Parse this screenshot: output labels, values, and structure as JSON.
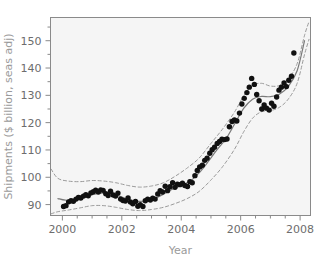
{
  "chart_data": {
    "type": "scatter",
    "title": "",
    "xlabel": "Year",
    "ylabel": "Shipments ($ billion, seas adj)",
    "xlim": [
      1999.6,
      2008.35
    ],
    "ylim": [
      86.0,
      158.5
    ],
    "grid": false,
    "legend": null,
    "x_major_ticks": [
      2000,
      2002,
      2004,
      2006,
      2008
    ],
    "x_major_tick_labels": [
      "2000",
      "2002",
      "2004",
      "2006",
      "2008"
    ],
    "x_minor_tick_step": 0.5,
    "y_major_ticks": [
      90,
      100,
      110,
      120,
      130,
      140,
      150
    ],
    "y_major_tick_labels": [
      "90",
      "100",
      "110",
      "120",
      "130",
      "140",
      "150"
    ],
    "y_minor_tick_step": 5,
    "series": [
      {
        "name": "Shipments (monthly observations)",
        "type": "scatter",
        "marker": "filled-circle",
        "color": "#111111",
        "x": [
          2000.04,
          2000.12,
          2000.21,
          2000.29,
          2000.37,
          2000.46,
          2000.54,
          2000.62,
          2000.71,
          2000.79,
          2000.87,
          2000.96,
          2001.04,
          2001.12,
          2001.21,
          2001.29,
          2001.37,
          2001.46,
          2001.54,
          2001.62,
          2001.71,
          2001.79,
          2001.87,
          2001.96,
          2002.04,
          2002.12,
          2002.21,
          2002.29,
          2002.37,
          2002.46,
          2002.54,
          2002.62,
          2002.71,
          2002.79,
          2002.87,
          2002.96,
          2003.04,
          2003.12,
          2003.21,
          2003.29,
          2003.37,
          2003.46,
          2003.54,
          2003.62,
          2003.71,
          2003.79,
          2003.87,
          2003.96,
          2004.04,
          2004.12,
          2004.21,
          2004.29,
          2004.37,
          2004.46,
          2004.54,
          2004.62,
          2004.71,
          2004.79,
          2004.87,
          2004.96,
          2005.04,
          2005.12,
          2005.21,
          2005.29,
          2005.37,
          2005.46,
          2005.54,
          2005.62,
          2005.71,
          2005.79,
          2005.87,
          2005.96,
          2006.04,
          2006.12,
          2006.21,
          2006.29,
          2006.37,
          2006.46,
          2006.54,
          2006.62,
          2006.71,
          2006.79,
          2006.87,
          2006.96,
          2007.04,
          2007.12,
          2007.21,
          2007.29,
          2007.37,
          2007.46,
          2007.54,
          2007.62,
          2007.71,
          2007.79
        ],
        "y": [
          89.3,
          89.6,
          91.0,
          91.4,
          91.2,
          92.0,
          92.6,
          92.4,
          93.1,
          93.6,
          93.2,
          94.3,
          94.7,
          95.3,
          94.6,
          95.4,
          95.2,
          94.0,
          93.3,
          94.9,
          93.5,
          93.1,
          94.2,
          92.0,
          91.5,
          91.3,
          92.4,
          90.9,
          90.3,
          91.1,
          89.4,
          90.0,
          89.3,
          91.4,
          92.0,
          91.7,
          92.3,
          92.0,
          93.9,
          95.1,
          94.6,
          96.7,
          95.1,
          96.5,
          98.0,
          96.3,
          97.5,
          97.3,
          97.8,
          97.0,
          96.6,
          98.4,
          98.0,
          100.6,
          102.5,
          103.8,
          104.4,
          106.2,
          107.0,
          108.8,
          110.1,
          111.0,
          112.4,
          113.1,
          113.9,
          113.8,
          114.0,
          118.5,
          120.4,
          121.0,
          120.6,
          123.5,
          126.8,
          128.9,
          131.0,
          133.0,
          136.2,
          134.0,
          130.3,
          128.0,
          125.0,
          126.5,
          125.3,
          124.6,
          127.1,
          126.0,
          129.4,
          131.9,
          133.0,
          134.5,
          133.2,
          135.5,
          137.0,
          145.5
        ]
      },
      {
        "name": "Smoothed trend (LOESS fit)",
        "type": "line",
        "style": "solid",
        "color": "#7a7a7a",
        "x": [
          1999.85,
          2000.1,
          2000.4,
          2000.7,
          2001.0,
          2001.3,
          2001.6,
          2001.9,
          2002.2,
          2002.5,
          2002.8,
          2003.1,
          2003.4,
          2003.7,
          2004.0,
          2004.3,
          2004.6,
          2004.9,
          2005.2,
          2005.5,
          2005.8,
          2006.1,
          2006.4,
          2006.7,
          2007.0,
          2007.3,
          2007.6,
          2007.9,
          2008.15
        ],
        "y": [
          92.2,
          91.6,
          91.8,
          92.6,
          93.6,
          94.2,
          94.0,
          93.2,
          92.0,
          91.2,
          91.3,
          92.2,
          93.8,
          95.6,
          97.0,
          98.6,
          101.6,
          105.6,
          110.0,
          114.0,
          119.6,
          125.2,
          128.6,
          129.6,
          129.5,
          130.4,
          133.2,
          139.0,
          150.0
        ]
      },
      {
        "name": "Upper confidence band",
        "type": "line",
        "style": "dashed",
        "color": "#9a9a9a",
        "x": [
          1999.62,
          1999.85,
          2000.2,
          2000.6,
          2001.0,
          2001.4,
          2001.8,
          2002.2,
          2002.6,
          2003.0,
          2003.4,
          2003.8,
          2004.2,
          2004.6,
          2005.0,
          2005.4,
          2005.8,
          2006.1,
          2006.4,
          2006.7,
          2007.0,
          2007.3,
          2007.6,
          2007.9,
          2008.15,
          2008.3
        ],
        "y": [
          103.0,
          99.6,
          98.6,
          98.4,
          98.8,
          98.6,
          98.0,
          97.0,
          96.4,
          96.8,
          98.0,
          100.4,
          103.4,
          107.0,
          112.4,
          117.8,
          124.0,
          129.8,
          133.6,
          134.4,
          133.4,
          133.6,
          136.0,
          141.6,
          152.0,
          157.0
        ]
      },
      {
        "name": "Lower confidence band",
        "type": "line",
        "style": "dashed",
        "color": "#9a9a9a",
        "x": [
          1999.62,
          1999.85,
          2000.2,
          2000.6,
          2001.0,
          2001.4,
          2001.8,
          2002.2,
          2002.6,
          2003.0,
          2003.4,
          2003.8,
          2004.2,
          2004.6,
          2005.0,
          2005.4,
          2005.8,
          2006.1,
          2006.4,
          2006.7,
          2007.0,
          2007.3,
          2007.6,
          2007.9,
          2008.15,
          2008.3
        ],
        "y": [
          86.6,
          87.4,
          88.0,
          88.8,
          89.6,
          89.6,
          89.0,
          88.2,
          87.8,
          88.2,
          89.0,
          90.4,
          92.2,
          94.8,
          99.0,
          104.0,
          110.4,
          116.6,
          121.6,
          124.0,
          124.4,
          125.6,
          128.6,
          134.4,
          145.0,
          150.5
        ]
      }
    ]
  },
  "figure": {
    "background_color": "#ffffff",
    "plot_background_color": "#f5f5f5",
    "frame_color": "#8a8a8a",
    "point_color": "#111111",
    "trend_color": "#7a7a7a",
    "band_color": "#9a9a9a",
    "tick_label_color": "#6d6d6d",
    "axis_title_color": "#9a9a9a"
  }
}
